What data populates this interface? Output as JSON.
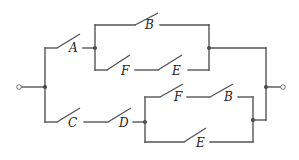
{
  "diagram": {
    "type": "switching-circuit",
    "colors": {
      "wire": "#555555",
      "node": "#444444",
      "background": "#ffffff"
    },
    "switches": {
      "A": "A",
      "B_top": "B",
      "F_top": "F",
      "E_top": "E",
      "C": "C",
      "D": "D",
      "F_bottom": "F",
      "B_bottom": "B",
      "E_bottom": "E"
    },
    "terminals": {
      "input": "input-terminal",
      "output": "output-terminal"
    },
    "structure": "(A and (B or (F and E))) or (C and D and ((F and B) or E))"
  }
}
